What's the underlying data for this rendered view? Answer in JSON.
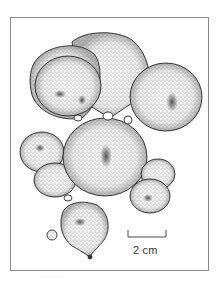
{
  "figure": {
    "scale_bar": {
      "label": "2 cm"
    },
    "caption_fragment": "· · ·  · · ·"
  },
  "colors": {
    "ink": "#2b2b2b",
    "frame": "#8a8a8a",
    "stipple_fill": "#d9d9d9",
    "shadow": "#555555",
    "background": "#ffffff"
  }
}
